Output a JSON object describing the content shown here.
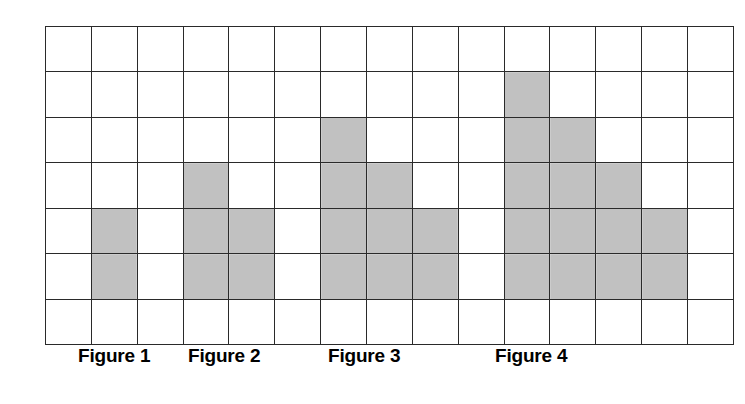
{
  "grid": {
    "columns": 15,
    "rows": 7,
    "fill_color": "#a9a9a9",
    "line_color": "#2a2a2a",
    "background_color": "#ffffff"
  },
  "chart_data": {
    "type": "table",
    "title": "",
    "subtitle": "",
    "xlabel": "",
    "ylabel": "",
    "grid_columns": 15,
    "grid_rows": 7,
    "categories": [
      "Figure 1",
      "Figure 2",
      "Figure 3",
      "Figure 4"
    ],
    "values": [
      2,
      5,
      9,
      14
    ],
    "series": [
      {
        "name": "shaded squares",
        "values": [
          2,
          5,
          9,
          14
        ]
      },
      {
        "name": "height (squares)",
        "values": [
          2,
          3,
          4,
          5
        ]
      },
      {
        "name": "width (columns)",
        "values": [
          1,
          2,
          3,
          4
        ]
      }
    ],
    "figures": [
      {
        "label": "Figure 1",
        "shaded_squares": 2,
        "height": 2,
        "width": 1,
        "column_heights": [
          2
        ],
        "cells": [
          [
            5,
            2
          ],
          [
            6,
            2
          ]
        ]
      },
      {
        "label": "Figure 2",
        "shaded_squares": 5,
        "height": 3,
        "width": 2,
        "column_heights": [
          3,
          2
        ],
        "cells": [
          [
            4,
            4
          ],
          [
            5,
            4
          ],
          [
            6,
            4
          ],
          [
            5,
            5
          ],
          [
            6,
            5
          ]
        ]
      },
      {
        "label": "Figure 3",
        "shaded_squares": 9,
        "height": 4,
        "width": 3,
        "column_heights": [
          4,
          3,
          2
        ],
        "cells": [
          [
            3,
            7
          ],
          [
            4,
            7
          ],
          [
            5,
            7
          ],
          [
            6,
            7
          ],
          [
            4,
            8
          ],
          [
            5,
            8
          ],
          [
            6,
            8
          ],
          [
            5,
            9
          ],
          [
            6,
            9
          ]
        ]
      },
      {
        "label": "Figure 4",
        "shaded_squares": 14,
        "height": 5,
        "width": 4,
        "column_heights": [
          5,
          4,
          3,
          2
        ],
        "cells": [
          [
            2,
            11
          ],
          [
            3,
            11
          ],
          [
            4,
            11
          ],
          [
            5,
            11
          ],
          [
            6,
            11
          ],
          [
            3,
            12
          ],
          [
            4,
            12
          ],
          [
            5,
            12
          ],
          [
            6,
            12
          ],
          [
            4,
            13
          ],
          [
            5,
            13
          ],
          [
            6,
            13
          ],
          [
            5,
            14
          ],
          [
            6,
            14
          ]
        ]
      }
    ],
    "filled_cells": [
      [
        5,
        2
      ],
      [
        6,
        2
      ],
      [
        4,
        4
      ],
      [
        5,
        4
      ],
      [
        6,
        4
      ],
      [
        5,
        5
      ],
      [
        6,
        5
      ],
      [
        3,
        7
      ],
      [
        4,
        7
      ],
      [
        5,
        7
      ],
      [
        6,
        7
      ],
      [
        4,
        8
      ],
      [
        5,
        8
      ],
      [
        6,
        8
      ],
      [
        5,
        9
      ],
      [
        6,
        9
      ],
      [
        2,
        11
      ],
      [
        3,
        11
      ],
      [
        4,
        11
      ],
      [
        5,
        11
      ],
      [
        6,
        11
      ],
      [
        3,
        12
      ],
      [
        4,
        12
      ],
      [
        5,
        12
      ],
      [
        6,
        12
      ],
      [
        4,
        13
      ],
      [
        5,
        13
      ],
      [
        6,
        13
      ],
      [
        5,
        14
      ],
      [
        6,
        14
      ]
    ],
    "grid": true,
    "legend": "none"
  },
  "labels": [
    {
      "text": "Figure 1"
    },
    {
      "text": "Figure 2"
    },
    {
      "text": "Figure 3"
    },
    {
      "text": "Figure 4"
    }
  ]
}
